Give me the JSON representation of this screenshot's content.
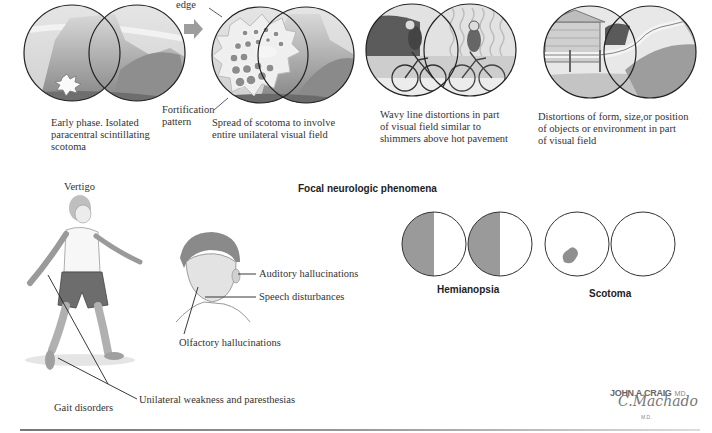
{
  "top_row": {
    "panel1": {
      "caption": [
        "Early phase. Isolated",
        "paracentral scintillating",
        "scotoma"
      ]
    },
    "panel2": {
      "edge_label": "edge",
      "fortification_label": [
        "Fortification",
        "pattern"
      ],
      "caption": [
        "Spread of scotoma to involve",
        "entire unilateral visual field"
      ]
    },
    "panel3": {
      "caption": [
        "Wavy line distortions in part",
        "of visual field similar to",
        "shimmers above hot pavement"
      ]
    },
    "panel4": {
      "caption": [
        "Distortions of form, size,or position",
        "of objects or environment in part",
        "of visual field"
      ]
    }
  },
  "section_title": "Focal neurologic phenomena",
  "figure_labels": {
    "vertigo": "Vertigo",
    "auditory": "Auditory hallucinations",
    "speech": "Speech disturbances",
    "olfactory": "Olfactory hallucinations",
    "weakness": "Unilateral weakness and paresthesias",
    "gait": "Gait disorders"
  },
  "visual_fields": {
    "hemianopsia": "Hemianopsia",
    "scotoma": "Scotoma",
    "shade_color": "#9a9a9a"
  },
  "signature": {
    "artist": "JOHN A.CRAIG",
    "artist_suffix": "MD",
    "co_artist": "C.Machado",
    "co_suffix": "M.D."
  }
}
